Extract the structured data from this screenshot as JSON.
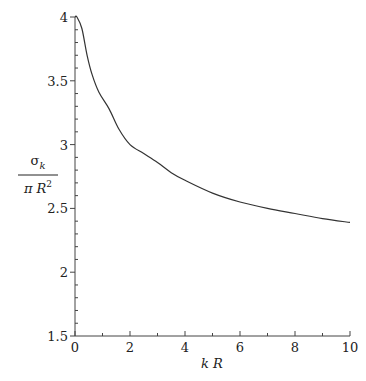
{
  "chart_data": {
    "type": "line",
    "title": "",
    "xlabel": "k R",
    "ylabel": {
      "numerator": "σ",
      "numerator_sub": "k",
      "denominator": "π R",
      "denominator_sup": "2"
    },
    "xlim": [
      0,
      10
    ],
    "ylim": [
      1.5,
      4
    ],
    "xticks": [
      0,
      2,
      4,
      6,
      8,
      10
    ],
    "xtick_labels": [
      "0",
      "2",
      "4",
      "6",
      "8",
      "10"
    ],
    "yticks": [
      1.5,
      2,
      2.5,
      3,
      3.5,
      4
    ],
    "ytick_labels": [
      "1.5",
      "2",
      "2.5",
      "3",
      "3.5",
      "4"
    ],
    "grid": false,
    "legend": null,
    "series": [
      {
        "name": "σk/(πR²)",
        "color": "#333333",
        "x": [
          0,
          0.07,
          0.25,
          0.44,
          0.62,
          0.87,
          1.24,
          1.6,
          2.0,
          2.5,
          3.0,
          3.5,
          4.0,
          5.0,
          6.0,
          7.0,
          8.0,
          9.0,
          10.0
        ],
        "y": [
          4.0,
          4.0,
          3.91,
          3.7,
          3.55,
          3.41,
          3.28,
          3.12,
          3.0,
          2.93,
          2.86,
          2.78,
          2.72,
          2.62,
          2.55,
          2.5,
          2.46,
          2.42,
          2.39
        ]
      }
    ]
  }
}
